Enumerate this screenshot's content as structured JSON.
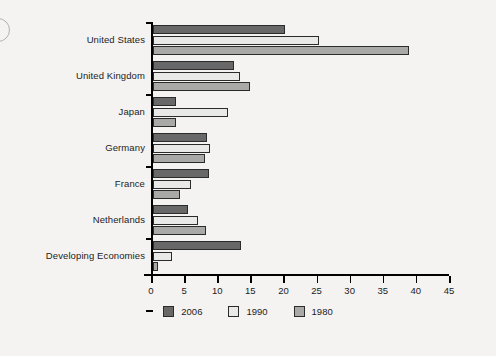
{
  "chart_data": {
    "type": "bar",
    "orientation": "horizontal",
    "title": "",
    "subtitle": "",
    "xlabel": "",
    "ylabel": "",
    "xlim": [
      0,
      45
    ],
    "xticks": [
      0,
      5,
      10,
      15,
      20,
      25,
      30,
      35,
      40,
      45
    ],
    "grid": false,
    "legend_position": "bottom-center",
    "categories": [
      "United States",
      "United Kingdom",
      "Japan",
      "Germany",
      "France",
      "Netherlands",
      "Developing Economies"
    ],
    "series": [
      {
        "name": "2006",
        "color": "#686868",
        "values": [
          20,
          12.3,
          3.5,
          8.2,
          8.5,
          5.3,
          13.3
        ]
      },
      {
        "name": "1990",
        "color": "#e9e9e7",
        "values": [
          25,
          13.1,
          11.4,
          8.6,
          5.8,
          6.8,
          2.9
        ]
      },
      {
        "name": "1980",
        "color": "#a9a9a7",
        "values": [
          38.7,
          14.7,
          3.5,
          7.9,
          4.1,
          8.0,
          0.8
        ]
      }
    ]
  },
  "legend": {
    "items": [
      {
        "label": "2006",
        "color": "#686868"
      },
      {
        "label": "1990",
        "color": "#e9e9e7"
      },
      {
        "label": "1980",
        "color": "#a9a9a7"
      }
    ]
  },
  "axis": {
    "x_tick_labels": [
      "0",
      "5",
      "10",
      "15",
      "20",
      "25",
      "30",
      "35",
      "40",
      "45"
    ]
  }
}
